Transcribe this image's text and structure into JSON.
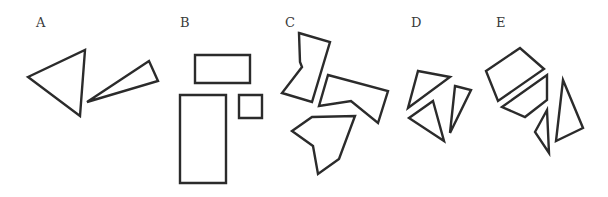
{
  "groups": [
    {
      "label": "A",
      "label_pos": [
        36,
        27
      ],
      "shapes": [
        {
          "kind": "triangle",
          "points": "28,77 85,50 80,116"
        },
        {
          "kind": "triangle",
          "points": "87,102 149,61 158,81"
        }
      ]
    },
    {
      "label": "B",
      "label_pos": [
        180,
        27
      ],
      "shapes": [
        {
          "kind": "rectangle",
          "points": "195,55 250,55 250,83 195,83"
        },
        {
          "kind": "rectangle",
          "points": "180,95 226,95 226,183 180,183"
        },
        {
          "kind": "square",
          "points": "239,95 262,95 262,118 239,118"
        }
      ]
    },
    {
      "label": "C",
      "label_pos": [
        285,
        27
      ],
      "shapes": [
        {
          "kind": "hexagon",
          "points": "299,33 330,42 312,102 282,93 302,67 300,62"
        },
        {
          "kind": "pentagon",
          "points": "328,75 388,91 378,123 351,101 319,106"
        },
        {
          "kind": "hexagon",
          "points": "312,117 355,116 339,159 318,174 313,146 292,131"
        }
      ]
    },
    {
      "label": "D",
      "label_pos": [
        411,
        27
      ],
      "shapes": [
        {
          "kind": "triangle",
          "points": "418,71 450,77 408,108"
        },
        {
          "kind": "triangle",
          "points": "433,101 444,141 409,118"
        },
        {
          "kind": "triangle",
          "points": "455,86 471,90 450,133"
        }
      ]
    },
    {
      "label": "E",
      "label_pos": [
        496,
        27
      ],
      "shapes": [
        {
          "kind": "quadrilateral",
          "points": "486,71 520,48 544,69 498,101"
        },
        {
          "kind": "quadrilateral",
          "points": "502,107 547,75 547,100 525,117"
        },
        {
          "kind": "triangle",
          "points": "535,132 547,110 549,153"
        },
        {
          "kind": "triangle",
          "points": "563,80 583,128 556,141"
        }
      ]
    }
  ]
}
